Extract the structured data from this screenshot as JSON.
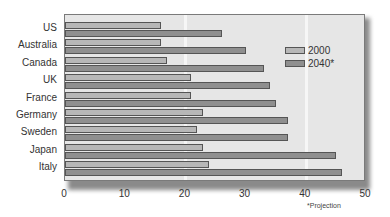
{
  "chart_data": {
    "type": "bar",
    "orientation": "horizontal",
    "title": "",
    "xlabel": "",
    "ylabel": "",
    "categories": [
      "US",
      "Australia",
      "Canada",
      "UK",
      "France",
      "Germany",
      "Sweden",
      "Japan",
      "Italy"
    ],
    "series": [
      {
        "name": "2000",
        "color": "#b7b7b7",
        "values": [
          16,
          16,
          17,
          21,
          21,
          23,
          22,
          23,
          24
        ]
      },
      {
        "name": "2040*",
        "color": "#8f8f8f",
        "values": [
          26,
          30,
          33,
          34,
          35,
          37,
          37,
          45,
          46
        ]
      }
    ],
    "xlim": [
      0,
      50
    ],
    "xticks": [
      "0",
      "10",
      "20",
      "30",
      "40",
      "50"
    ],
    "grid": {
      "vertical_at": [
        20,
        40
      ]
    },
    "legend": {
      "position": "upper right inside",
      "entries": [
        "2000",
        "2040*"
      ]
    },
    "annotation": "*Projection"
  }
}
